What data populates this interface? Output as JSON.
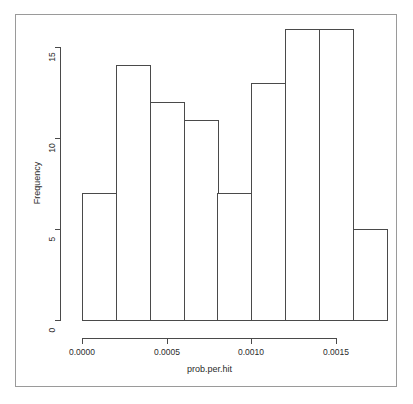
{
  "figure": {
    "clipped_title": "",
    "frame_color": "#9a9a9a",
    "plot_ink_color": "#4a4a4a",
    "background": "#ffffff"
  },
  "chart_data": {
    "type": "bar",
    "title": "",
    "xlabel": "prob.per.hit",
    "ylabel": "Frequency",
    "categories": [
      "0.0000-0.0002",
      "0.0002-0.0004",
      "0.0004-0.0006",
      "0.0006-0.0008",
      "0.0008-0.0010",
      "0.0010-0.0012",
      "0.0012-0.0014",
      "0.0014-0.0016",
      "0.0016-0.0018"
    ],
    "bin_edges": [
      0.0,
      0.0002,
      0.0004,
      0.0006,
      0.0008,
      0.001,
      0.0012,
      0.0014,
      0.0016,
      0.0018
    ],
    "values": [
      7,
      14,
      12,
      11,
      7,
      13,
      16,
      16,
      5
    ],
    "xlim": [
      0.0,
      0.0018
    ],
    "ylim": [
      0,
      16
    ],
    "xticks": [
      0.0,
      0.0005,
      0.001,
      0.0015
    ],
    "xtick_labels": [
      "0.0000",
      "0.0005",
      "0.0010",
      "0.0015"
    ],
    "yticks": [
      0,
      5,
      10,
      15
    ],
    "ytick_labels": [
      "0",
      "5",
      "10",
      "15"
    ],
    "grid": false,
    "legend": null,
    "bar_fill": "#ffffff",
    "bar_edge": "#4a4a4a"
  }
}
